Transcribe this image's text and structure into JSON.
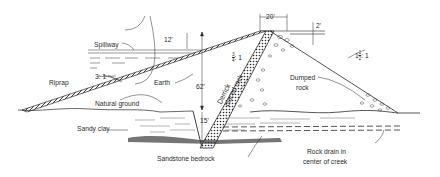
{
  "diagram": {
    "type": "dam cross-section",
    "dimensions": {
      "crest_width": "20'",
      "freeboard": "2'",
      "spillway_depth": "12'",
      "height": "62'",
      "cutoff_depth": "15'"
    },
    "slopes": {
      "upstream": "3: 1",
      "core_wall": "3/4 : 1",
      "core_wall_num": "3",
      "core_wall_den": "4",
      "core_wall_suffix": ": 1",
      "downstream": "1 1/2 : 1",
      "downstream_whole": "1",
      "downstream_num": "1",
      "downstream_den": "2",
      "downstream_suffix": ": 1"
    },
    "labels": {
      "spillway": "Spillway",
      "riprap": "Riprap",
      "earth": "Earth",
      "derrick_line1": "Derrick",
      "derrick_line2": "placed rock",
      "dumped_line1": "Dumped",
      "dumped_line2": "rock",
      "natural_ground": "Natural ground",
      "sandy_clay": "Sandy clay",
      "sandstone_bedrock": "Sandstone bedrock",
      "rock_drain_line1": "Rock drain in",
      "rock_drain_line2": "center of creek"
    },
    "colors": {
      "ink": "#2a2a2a",
      "background": "#ffffff"
    }
  }
}
